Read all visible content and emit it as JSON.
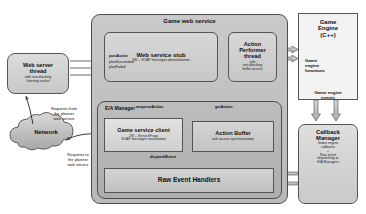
{
  "diagram": {
    "containers": {
      "game_web_service": {
        "label": "Game web service"
      },
      "ea_manager": {
        "label": "E/A Manager"
      }
    },
    "nodes": {
      "web_server_thread": {
        "title": "Web server\nthread",
        "subtitle": "with non-blocking\nlistening socket"
      },
      "web_service_stub": {
        "title": "Web service stub",
        "subtitle": "ZSI – SOAP messages deserialization",
        "methods": [
          {
            "name": "postAction",
            "bold": true
          },
          {
            "name": "planSucceeded",
            "bold": false
          },
          {
            "name": "planFailed",
            "bold": false
          }
        ]
      },
      "action_performer": {
        "title": "Action\nPerformer\nthread",
        "subtitle": "with\nnon-blocking\nbuffer access"
      },
      "game_service_client": {
        "title": "Game service client",
        "subtitle": "ZSI – ServiceProxy\nSOAP messages serialization"
      },
      "action_buffer": {
        "title": "Action Buffer",
        "subtitle": "with access synchronization"
      },
      "raw_event_handlers": {
        "title": "Raw Event Handlers"
      },
      "game_engine": {
        "title": "Game\nEngine\n(C++)",
        "functions_label": "Game\nengine\nfunctions",
        "events_label": "Game engine\nevents"
      },
      "callback_manager": {
        "title": "Callback\nManager",
        "subtitle": "Game engine\ncallbacks\n+\nRaw event\ndispatching to\nE/A Managers"
      },
      "network": {
        "label": "Network"
      }
    },
    "edge_labels": {
      "enqueue_action": "enqueueAction",
      "get_action": "getAction",
      "dispatch_event": "dispatchEvent",
      "requests_from_planner": "Requests from\nthe planner\nweb service",
      "requests_to_planner": "Requests to\nthe planner\nweb service"
    },
    "colors": {
      "container_fill": "#c3c3c3",
      "node_fill": "#d2d2d2",
      "stroke": "#4d4d4d",
      "arrow": "#555555",
      "text": "#111111"
    }
  }
}
